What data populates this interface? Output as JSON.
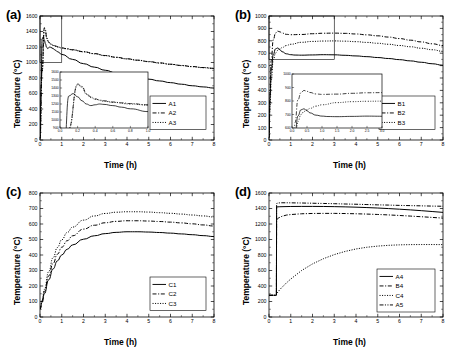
{
  "figure": {
    "panel_labels": [
      "(a)",
      "(b)",
      "(c)",
      "(d)"
    ],
    "axis_titles": {
      "x": "Time (h)",
      "y": "Temperature (°C)"
    }
  },
  "chart_data": [
    {
      "type": "line",
      "panel": "(a)",
      "title": "",
      "xlabel": "Time (h)",
      "ylabel": "Temperature (°C)",
      "xlim": [
        0,
        8
      ],
      "ylim": [
        0,
        1600
      ],
      "xticks": [
        0,
        1,
        2,
        3,
        4,
        5,
        6,
        7,
        8
      ],
      "yticks": [
        0,
        200,
        400,
        600,
        800,
        1000,
        1200,
        1400,
        1600
      ],
      "grid": false,
      "legend_position": "right-middle",
      "series": [
        {
          "name": "A1",
          "style": "solid",
          "x": [
            0,
            0.05,
            0.1,
            0.15,
            0.2,
            0.25,
            0.3,
            0.35,
            0.4,
            0.45,
            0.5,
            0.6,
            0.7,
            0.8,
            1.0,
            1.5,
            2.0,
            2.5,
            3.0,
            3.5,
            4.0,
            4.5,
            5.0,
            5.5,
            6.0,
            6.5,
            7.0,
            7.5,
            8.0
          ],
          "y": [
            20,
            700,
            1300,
            1330,
            1290,
            1240,
            1200,
            1180,
            1190,
            1200,
            1195,
            1180,
            1160,
            1140,
            1105,
            1040,
            985,
            940,
            900,
            865,
            835,
            810,
            785,
            762,
            740,
            720,
            700,
            685,
            670
          ]
        },
        {
          "name": "A2",
          "style": "dashdot",
          "x": [
            0,
            0.1,
            0.2,
            0.25,
            0.3,
            0.35,
            0.4,
            0.45,
            0.5,
            0.6,
            0.7,
            0.8,
            1.0,
            1.2,
            1.5,
            2.0,
            2.5,
            3.0,
            3.5,
            4.0,
            4.5,
            5.0,
            5.5,
            6.0,
            6.5,
            7.0,
            7.5,
            8.0
          ],
          "y": [
            20,
            900,
            1450,
            1420,
            1330,
            1290,
            1265,
            1250,
            1240,
            1225,
            1215,
            1205,
            1190,
            1180,
            1165,
            1140,
            1115,
            1090,
            1068,
            1048,
            1030,
            1012,
            995,
            978,
            962,
            948,
            935,
            925
          ]
        },
        {
          "name": "A3",
          "style": "dotted",
          "x": [
            0,
            0.1,
            0.2,
            0.25,
            0.3,
            0.35,
            0.4,
            0.5,
            0.6,
            0.8,
            1.0,
            1.2,
            1.5,
            2.0,
            2.5,
            3.0,
            3.5,
            4.0,
            4.5,
            5.0,
            5.5,
            6.0,
            6.5,
            7.0,
            7.5,
            8.0
          ],
          "y": [
            20,
            880,
            1440,
            1410,
            1320,
            1280,
            1258,
            1235,
            1220,
            1200,
            1186,
            1176,
            1162,
            1137,
            1112,
            1088,
            1066,
            1046,
            1028,
            1010,
            993,
            976,
            960,
            946,
            933,
            923
          ]
        }
      ],
      "inset": {
        "xlim": [
          0.0,
          1.0
        ],
        "ylim": [
          900,
          1600
        ],
        "xticks": [
          "0.0",
          "0.2",
          "0.4",
          "0.6",
          "0.8",
          "1.0"
        ],
        "yticks": [
          "900",
          "1000",
          "1100",
          "1200",
          "1300",
          "1400",
          "1500",
          "1600"
        ]
      },
      "zoom_region": {
        "x": [
          0,
          1.0
        ],
        "y": [
          1000,
          1600
        ]
      }
    },
    {
      "type": "line",
      "panel": "(b)",
      "title": "",
      "xlabel": "Time (h)",
      "ylabel": "Temperature (°C)",
      "xlim": [
        0,
        8
      ],
      "ylim": [
        0,
        1000
      ],
      "xticks": [
        0,
        1,
        2,
        3,
        4,
        5,
        6,
        7,
        8
      ],
      "yticks": [
        0,
        100,
        200,
        300,
        400,
        500,
        600,
        700,
        800,
        900,
        1000
      ],
      "grid": false,
      "legend_position": "right-middle",
      "series": [
        {
          "name": "B1",
          "style": "solid",
          "x": [
            0,
            0.05,
            0.1,
            0.2,
            0.3,
            0.4,
            0.5,
            0.6,
            0.8,
            1.0,
            1.2,
            1.5,
            2.0,
            2.5,
            3.0,
            3.5,
            4.0,
            4.5,
            5.0,
            5.5,
            6.0,
            6.5,
            7.0,
            7.5,
            8.0
          ],
          "y": [
            20,
            350,
            560,
            690,
            735,
            742,
            728,
            712,
            695,
            688,
            685,
            684,
            686,
            688,
            687,
            683,
            678,
            672,
            665,
            657,
            648,
            638,
            627,
            615,
            603
          ]
        },
        {
          "name": "B2",
          "style": "dashdot",
          "x": [
            0,
            0.05,
            0.1,
            0.2,
            0.3,
            0.4,
            0.5,
            0.6,
            0.8,
            1.0,
            1.5,
            2.0,
            2.5,
            3.0,
            3.5,
            4.0,
            4.5,
            5.0,
            5.5,
            6.0,
            6.5,
            7.0,
            7.5,
            8.0
          ],
          "y": [
            20,
            400,
            640,
            810,
            862,
            878,
            872,
            863,
            852,
            849,
            851,
            857,
            861,
            862,
            860,
            855,
            848,
            840,
            830,
            818,
            805,
            791,
            776,
            762
          ]
        },
        {
          "name": "B3",
          "style": "dotted",
          "x": [
            0,
            0.05,
            0.1,
            0.2,
            0.3,
            0.4,
            0.5,
            0.6,
            0.8,
            1.0,
            1.5,
            2.0,
            2.5,
            3.0,
            3.5,
            4.0,
            4.5,
            5.0,
            5.5,
            6.0,
            6.5,
            7.0,
            7.5,
            8.0
          ],
          "y": [
            20,
            280,
            480,
            648,
            700,
            722,
            735,
            745,
            762,
            772,
            788,
            795,
            798,
            799,
            797,
            793,
            787,
            780,
            772,
            762,
            752,
            740,
            728,
            715
          ]
        }
      ],
      "inset": {
        "xlim": [
          0.0,
          3.0
        ],
        "ylim": [
          600,
          1000
        ],
        "xticks": [
          "0.0",
          "0.5",
          "1.0",
          "1.5",
          "2.0",
          "2.5",
          "3.0"
        ],
        "yticks": [
          "600",
          "700",
          "800",
          "900",
          "1000"
        ]
      },
      "zoom_region": {
        "x": [
          0,
          3.0
        ],
        "y": [
          650,
          1000
        ]
      }
    },
    {
      "type": "line",
      "panel": "(c)",
      "title": "",
      "xlabel": "Time (h)",
      "ylabel": "Temperature (°C)",
      "xlim": [
        0,
        8
      ],
      "ylim": [
        0,
        800
      ],
      "xticks": [
        0,
        1,
        2,
        3,
        4,
        5,
        6,
        7,
        8
      ],
      "yticks": [
        0,
        100,
        200,
        300,
        400,
        500,
        600,
        700,
        800
      ],
      "grid": false,
      "legend_position": "right-lower",
      "series": [
        {
          "name": "C1",
          "style": "solid",
          "x": [
            0,
            0.1,
            0.2,
            0.4,
            0.6,
            0.8,
            1.0,
            1.25,
            1.5,
            2.0,
            2.5,
            3.0,
            3.5,
            4.0,
            4.5,
            5.0,
            5.5,
            6.0,
            6.5,
            7.0,
            7.5,
            8.0
          ],
          "y": [
            50,
            95,
            150,
            240,
            310,
            362,
            400,
            437,
            465,
            502,
            524,
            538,
            546,
            550,
            550,
            548,
            545,
            541,
            536,
            531,
            525,
            519
          ]
        },
        {
          "name": "C2",
          "style": "dashdot",
          "x": [
            0,
            0.1,
            0.2,
            0.4,
            0.6,
            0.8,
            1.0,
            1.25,
            1.5,
            2.0,
            2.5,
            3.0,
            3.5,
            4.0,
            4.5,
            5.0,
            5.5,
            6.0,
            6.5,
            7.0,
            7.5,
            8.0
          ],
          "y": [
            50,
            102,
            163,
            265,
            345,
            405,
            450,
            492,
            524,
            567,
            592,
            608,
            617,
            621,
            621,
            619,
            616,
            612,
            607,
            601,
            594,
            587
          ]
        },
        {
          "name": "C3",
          "style": "dotted",
          "x": [
            0,
            0.1,
            0.2,
            0.4,
            0.6,
            0.8,
            1.0,
            1.25,
            1.5,
            2.0,
            2.5,
            3.0,
            3.5,
            4.0,
            4.5,
            5.0,
            5.5,
            6.0,
            6.5,
            7.0,
            7.5,
            8.0
          ],
          "y": [
            50,
            110,
            178,
            292,
            382,
            448,
            498,
            545,
            580,
            625,
            652,
            668,
            676,
            679,
            679,
            677,
            673,
            669,
            664,
            658,
            652,
            645
          ]
        }
      ]
    },
    {
      "type": "line",
      "panel": "(d)",
      "title": "",
      "xlabel": "Time (h)",
      "ylabel": "Temperature (°C)",
      "xlim": [
        0,
        8
      ],
      "ylim": [
        0,
        1600
      ],
      "xticks": [
        0,
        1,
        2,
        3,
        4,
        5,
        6,
        7,
        8
      ],
      "yticks": [
        0,
        200,
        400,
        600,
        800,
        1000,
        1200,
        1400,
        1600
      ],
      "grid": false,
      "legend_position": "right-lower",
      "series": [
        {
          "name": "A4",
          "style": "solid",
          "x": [
            0,
            0.1,
            0.2,
            0.3,
            0.34,
            0.35,
            0.5,
            1.0,
            1.5,
            2.0,
            2.5,
            3.0,
            3.5,
            4.0,
            4.5,
            5.0,
            5.5,
            6.0,
            6.5,
            7.0,
            7.5,
            8.0
          ],
          "y": [
            280,
            280,
            280,
            280,
            280,
            1420,
            1423,
            1426,
            1427,
            1427,
            1426,
            1424,
            1421,
            1417,
            1412,
            1406,
            1399,
            1391,
            1382,
            1372,
            1361,
            1350
          ]
        },
        {
          "name": "B4",
          "style": "dashdot",
          "x": [
            0,
            0.1,
            0.2,
            0.3,
            0.34,
            0.35,
            0.45,
            0.6,
            0.8,
            1.0,
            1.5,
            2.0,
            2.5,
            3.0,
            3.5,
            4.0,
            4.5,
            5.0,
            5.5,
            6.0,
            6.5,
            7.0,
            7.5,
            8.0
          ],
          "y": [
            280,
            280,
            280,
            280,
            280,
            1255,
            1280,
            1300,
            1315,
            1322,
            1332,
            1336,
            1337,
            1337,
            1335,
            1332,
            1328,
            1323,
            1317,
            1310,
            1302,
            1294,
            1285,
            1276
          ]
        },
        {
          "name": "C4",
          "style": "dotted",
          "x": [
            0,
            0.1,
            0.2,
            0.3,
            0.34,
            0.35,
            0.5,
            0.8,
            1.0,
            1.5,
            2.0,
            2.5,
            3.0,
            3.5,
            4.0,
            4.5,
            5.0,
            5.5,
            6.0,
            6.5,
            7.0,
            7.5,
            8.0
          ],
          "y": [
            280,
            280,
            280,
            280,
            280,
            300,
            355,
            440,
            490,
            600,
            685,
            752,
            805,
            846,
            878,
            900,
            915,
            925,
            931,
            934,
            935,
            935,
            934
          ]
        },
        {
          "name": "A5",
          "style": "dashdotdot",
          "x": [
            0,
            0.1,
            0.2,
            0.3,
            0.34,
            0.35,
            0.45,
            0.6,
            0.8,
            1.0,
            1.5,
            2.0,
            2.5,
            3.0,
            3.5,
            4.0,
            4.5,
            5.0,
            5.5,
            6.0,
            6.5,
            7.0,
            7.5,
            8.0
          ],
          "y": [
            280,
            280,
            280,
            280,
            280,
            1465,
            1472,
            1474,
            1474,
            1473,
            1471,
            1468,
            1465,
            1462,
            1458,
            1455,
            1451,
            1447,
            1444,
            1440,
            1437,
            1434,
            1431,
            1429
          ]
        }
      ]
    }
  ]
}
